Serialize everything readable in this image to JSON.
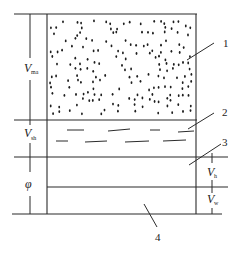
{
  "diagram": {
    "type": "layered volume model",
    "left_labels": [
      {
        "symbol": "V",
        "subscript": "ma",
        "meaning_region": "layer 1 (matrix)"
      },
      {
        "symbol": "V",
        "subscript": "sh",
        "meaning_region": "layer 2 (shale)"
      },
      {
        "symbol": "φ",
        "subscript": "",
        "meaning_region": "layers 3+4 (porosity)"
      }
    ],
    "right_labels": [
      {
        "symbol": "V",
        "subscript": "h",
        "meaning_region": "layer 3"
      },
      {
        "symbol": "V",
        "subscript": "w",
        "meaning_region": "layer 4"
      }
    ],
    "callouts": [
      "1",
      "2",
      "3",
      "4"
    ]
  }
}
